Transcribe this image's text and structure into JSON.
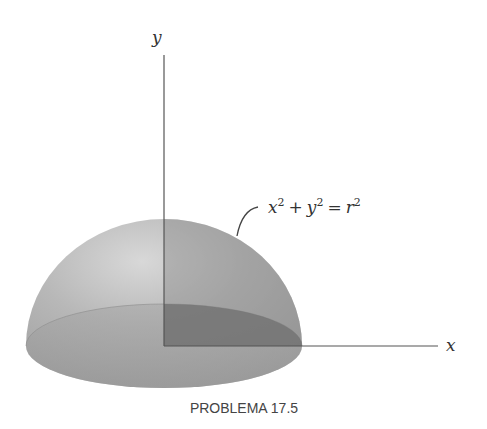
{
  "figure": {
    "axes": {
      "y_label": "y",
      "x_label": "x"
    },
    "equation": {
      "lhs_x": "x",
      "lhs_y": "y",
      "exp": "2",
      "plus": "+",
      "equals": "=",
      "rhs": "r"
    },
    "caption": "PROBLEMA 17.5",
    "colors": {
      "background": "#ffffff",
      "shell_light": "#c9c9c9",
      "shell_mid": "#a8a8a8",
      "base_disk": "#9a9a9a",
      "quadrant_dark": "#7a7a7a",
      "axis": "#555555"
    }
  }
}
